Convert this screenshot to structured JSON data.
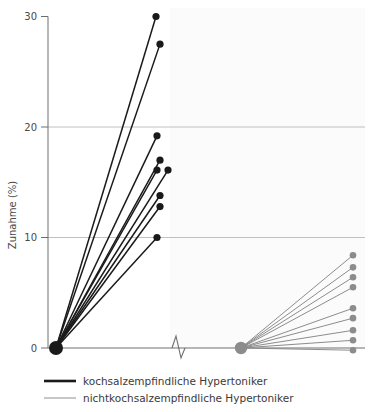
{
  "chart_data": {
    "type": "scatter",
    "title": "",
    "xlabel": "",
    "ylabel": "Zunahme (%)",
    "ylim": [
      0,
      30
    ],
    "yticks": [
      0,
      10,
      20,
      30
    ],
    "ytick_labels": [
      "0",
      "10",
      "20",
      "30"
    ],
    "grid": "horizontal gridlines at 10, 20 and baseline at 0",
    "legend_position": "below-axes-left",
    "axis_break": "zigzag break on x-axis between the two groups",
    "series": [
      {
        "name": "kochsalzempfindliche Hypertoniker",
        "color": "#1a1a1a",
        "origin_value": 0,
        "values": [
          30.0,
          27.5,
          19.2,
          17.0,
          16.1,
          16.1,
          13.8,
          12.8,
          10.0
        ],
        "n": 9
      },
      {
        "name": "nichtkochsalzempfindliche Hypertoniker",
        "color": "#8c8c8c",
        "origin_value": 0,
        "values": [
          8.4,
          7.3,
          6.4,
          5.5,
          3.6,
          2.7,
          1.6,
          0.7,
          -0.2
        ],
        "n": 9
      }
    ]
  },
  "legend": {
    "entries": [
      {
        "label": "kochsalzempfindliche Hypertoniker",
        "color": "#1a1a1a",
        "width": 2.6
      },
      {
        "label": "nichtkochsalzempfindliche Hypertoniker",
        "color": "#9a9a9a",
        "width": 1.1
      }
    ]
  },
  "colors": {
    "black_series": "#1a1a1a",
    "gray_series": "#8c8c8c",
    "gridline": "#b9b9b9",
    "axis": "#6e6e6e",
    "panel": "#fbfbfb",
    "text": "#4a4a4a"
  }
}
